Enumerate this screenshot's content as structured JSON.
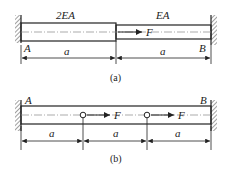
{
  "figure_a": {
    "caption": "(a)",
    "segment_left_label": "2EA",
    "segment_right_label": "EA",
    "force_label": "F",
    "point_left": "A",
    "point_right": "B",
    "dim_left": "a",
    "dim_right": "a"
  },
  "figure_b": {
    "caption": "(b)",
    "force_label_1": "F",
    "force_label_2": "F",
    "point_left": "A",
    "point_right": "B",
    "dims": [
      "a",
      "a",
      "a"
    ]
  },
  "colors": {
    "line": "#222222",
    "hatch": "#444444",
    "background": "#ffffff"
  }
}
